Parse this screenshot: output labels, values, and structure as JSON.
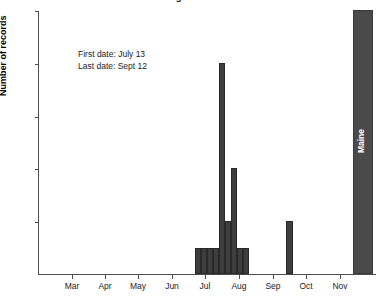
{
  "chart_data": {
    "type": "bar",
    "title": "Number of records of ... in our region",
    "xlabel": "",
    "ylabel": "Number of records",
    "ylim": [
      0,
      10
    ],
    "yticks": [
      2,
      4,
      6,
      8,
      10
    ],
    "grid": false,
    "legend": null,
    "xtick_labels": [
      "Mar",
      "Apr",
      "May",
      "Jun",
      "Jul",
      "Aug",
      "Sep",
      "Oct",
      "Nov"
    ],
    "categories": [
      "Jul 13",
      "Jul 20",
      "Jul 27",
      "Aug 3",
      "Aug 10",
      "Aug 17",
      "Aug 24",
      "Aug 31",
      "Sep 7",
      "Sep 28"
    ],
    "values": [
      1,
      1,
      1,
      1,
      8,
      2,
      4,
      1,
      1,
      2
    ],
    "annotations": [
      "First date: July 13",
      "Last date: Sept 12"
    ],
    "state_bar": {
      "label": "Maine",
      "value": 10,
      "clipped": true
    },
    "colors": {
      "bar": "#3d3d3d",
      "state_bar": "#4a4a4a",
      "axis": "#4d4d4d",
      "text": "#1a1a1a",
      "background": "#ffffff"
    }
  },
  "bars": [
    {
      "x": 194.0,
      "w": 6.0,
      "value": 1
    },
    {
      "x": 200.0,
      "w": 6.0,
      "value": 1
    },
    {
      "x": 206.0,
      "w": 6.0,
      "value": 1
    },
    {
      "x": 212.0,
      "w": 6.0,
      "value": 1
    },
    {
      "x": 218.0,
      "w": 6.0,
      "value": 8
    },
    {
      "x": 224.0,
      "w": 6.0,
      "value": 2
    },
    {
      "x": 230.0,
      "w": 6.0,
      "value": 4
    },
    {
      "x": 236.0,
      "w": 6.0,
      "value": 1
    },
    {
      "x": 242.0,
      "w": 6.0,
      "value": 1
    },
    {
      "x": 285.0,
      "w": 7.0,
      "value": 2
    }
  ],
  "xticks": [
    {
      "label": "Mar",
      "x": 71
    },
    {
      "label": "Apr",
      "x": 104
    },
    {
      "label": "May",
      "x": 137
    },
    {
      "label": "Jun",
      "x": 171
    },
    {
      "label": "Jul",
      "x": 204
    },
    {
      "label": "Aug",
      "x": 238
    },
    {
      "label": "Sep",
      "x": 272
    },
    {
      "label": "Oct",
      "x": 305
    },
    {
      "label": "Nov",
      "x": 339
    }
  ]
}
